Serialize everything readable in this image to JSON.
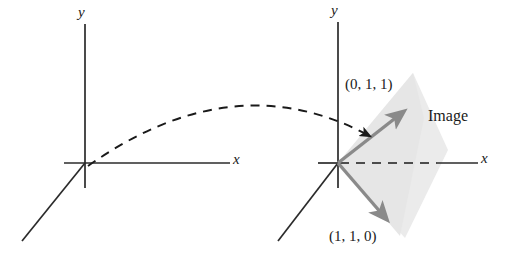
{
  "figure": {
    "title_visible": false,
    "background_color": "#ffffff",
    "axis_color": "#2b2b2b",
    "vector_color": "#8a8a8a",
    "shade_color": "#e9e9e9",
    "dash_color": "#1a1a1a",
    "text_color": "#1a1a1a"
  },
  "left_diagram": {
    "name": "domain-coordinate-system",
    "origin": {
      "x": 85,
      "y": 163
    },
    "y_axis_label": "y",
    "x_axis_label": "x",
    "axes": {
      "y_top": {
        "x": 85,
        "y": 24
      },
      "y_bottom": {
        "x": 85,
        "y": 188
      },
      "x_right": {
        "x": 230,
        "y": 163
      },
      "x_left": {
        "x": 64,
        "y": 163
      },
      "z_end": {
        "x": 22,
        "y": 241
      }
    }
  },
  "right_diagram": {
    "name": "image-coordinate-system",
    "origin": {
      "x": 338,
      "y": 163
    },
    "y_axis_label": "y",
    "x_axis_label": "x",
    "axes": {
      "y_top": {
        "x": 338,
        "y": 22
      },
      "y_bottom": {
        "x": 338,
        "y": 188
      },
      "x_right": {
        "x": 478,
        "y": 163
      },
      "x_left": {
        "x": 318,
        "y": 163
      },
      "z_end": {
        "x": 278,
        "y": 241
      }
    },
    "x_axis_dash_until": 437,
    "vectors": [
      {
        "label": "(0, 1, 1)",
        "from": {
          "x": 338,
          "y": 163
        },
        "to": {
          "x": 404,
          "y": 111
        },
        "label_pos": {
          "x": 345,
          "y": 75
        }
      },
      {
        "label": "(1, 1, 0)",
        "from": {
          "x": 338,
          "y": 163
        },
        "to": {
          "x": 388,
          "y": 222
        },
        "label_pos": {
          "x": 330,
          "y": 226
        }
      }
    ],
    "shaded_region_label": "Image",
    "shaded_region_label_pos": {
      "x": 428,
      "y": 108
    }
  },
  "mapping_arrow": {
    "name": "transformation-arrow",
    "style": "dashed-curve-with-arrowhead",
    "start": {
      "x": 88,
      "y": 166
    },
    "control": {
      "x": 230,
      "y": 70
    },
    "end": {
      "x": 372,
      "y": 139
    }
  }
}
